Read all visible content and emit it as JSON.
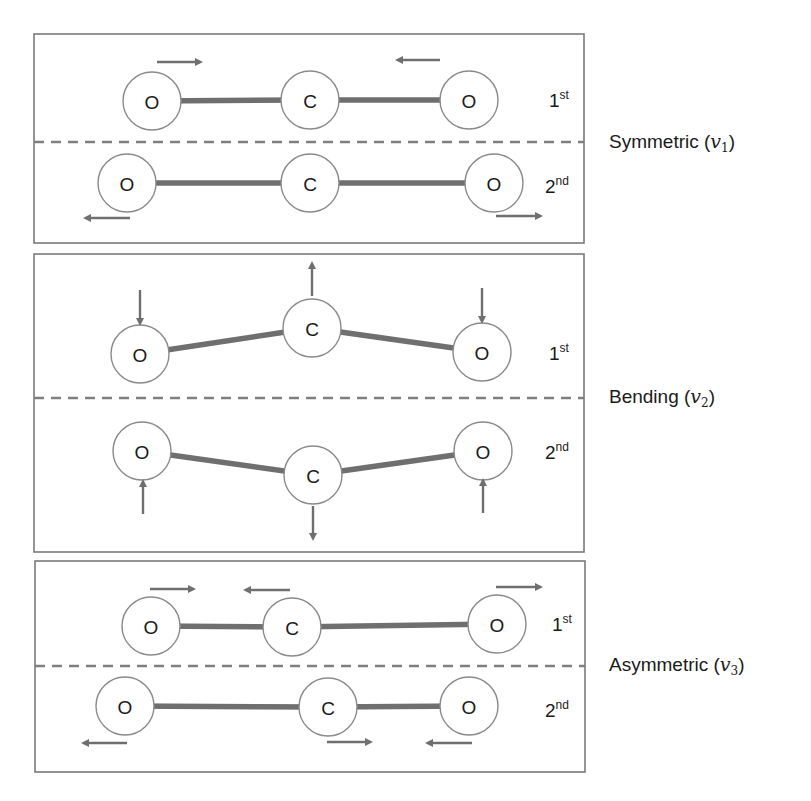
{
  "colors": {
    "stroke": "#6f6f6f",
    "panel_border": "#7a7a7a",
    "atom_fill": "#ffffff",
    "text": "#1a1a1a"
  },
  "panels": [
    {
      "name": "symmetric",
      "mode_label": "Symmetric",
      "mode_symbol": "v",
      "mode_subscript": "1",
      "rows": [
        {
          "order": "1",
          "order_sup": "st",
          "atoms": [
            {
              "label": "O",
              "cx": 152,
              "cy": 101
            },
            {
              "label": "C",
              "cx": 310,
              "cy": 100
            },
            {
              "label": "O",
              "cx": 469,
              "cy": 100
            }
          ],
          "arrows": [
            {
              "dir": "right",
              "x1": 157,
              "y1": 62,
              "x2": 200,
              "y2": 62
            },
            {
              "dir": "left",
              "x1": 440,
              "y1": 60,
              "x2": 398,
              "y2": 60
            }
          ]
        },
        {
          "order": "2",
          "order_sup": "nd",
          "atoms": [
            {
              "label": "O",
              "cx": 127,
              "cy": 183
            },
            {
              "label": "C",
              "cx": 310,
              "cy": 183
            },
            {
              "label": "O",
              "cx": 494,
              "cy": 183
            }
          ],
          "arrows": [
            {
              "dir": "left",
              "x1": 130,
              "y1": 218,
              "x2": 86,
              "y2": 218
            },
            {
              "dir": "right",
              "x1": 496,
              "y1": 216,
              "x2": 540,
              "y2": 216
            }
          ]
        }
      ]
    },
    {
      "name": "bending",
      "mode_label": "Bending",
      "mode_symbol": "v",
      "mode_subscript": "2",
      "rows": [
        {
          "order": "1",
          "order_sup": "st",
          "atoms": [
            {
              "label": "O",
              "cx": 140,
              "cy": 354
            },
            {
              "label": "C",
              "cx": 312,
              "cy": 328
            },
            {
              "label": "O",
              "cx": 482,
              "cy": 352
            }
          ],
          "arrows": [
            {
              "dir": "down",
              "x1": 140,
              "y1": 290,
              "x2": 140,
              "y2": 323
            },
            {
              "dir": "up",
              "x1": 312,
              "y1": 296,
              "x2": 312,
              "y2": 264
            },
            {
              "dir": "down",
              "x1": 482,
              "y1": 288,
              "x2": 482,
              "y2": 321
            }
          ]
        },
        {
          "order": "2",
          "order_sup": "nd",
          "atoms": [
            {
              "label": "O",
              "cx": 142,
              "cy": 451
            },
            {
              "label": "C",
              "cx": 313,
              "cy": 475
            },
            {
              "label": "O",
              "cx": 483,
              "cy": 451
            }
          ],
          "arrows": [
            {
              "dir": "up",
              "x1": 143,
              "y1": 514,
              "x2": 143,
              "y2": 482
            },
            {
              "dir": "down",
              "x1": 313,
              "y1": 506,
              "x2": 313,
              "y2": 538
            },
            {
              "dir": "up",
              "x1": 483,
              "y1": 513,
              "x2": 483,
              "y2": 481
            }
          ]
        }
      ]
    },
    {
      "name": "asymmetric",
      "mode_label": "Asymmetric",
      "mode_symbol": "v",
      "mode_subscript": "3",
      "rows": [
        {
          "order": "1",
          "order_sup": "st",
          "atoms": [
            {
              "label": "O",
              "cx": 151,
              "cy": 626
            },
            {
              "label": "C",
              "cx": 292,
              "cy": 627
            },
            {
              "label": "O",
              "cx": 497,
              "cy": 624
            }
          ],
          "arrows": [
            {
              "dir": "right",
              "x1": 150,
              "y1": 589,
              "x2": 193,
              "y2": 589
            },
            {
              "dir": "left",
              "x1": 290,
              "y1": 590,
              "x2": 246,
              "y2": 590
            },
            {
              "dir": "right",
              "x1": 496,
              "y1": 587,
              "x2": 540,
              "y2": 587
            }
          ]
        },
        {
          "order": "2",
          "order_sup": "nd",
          "atoms": [
            {
              "label": "O",
              "cx": 125,
              "cy": 706
            },
            {
              "label": "C",
              "cx": 328,
              "cy": 707
            },
            {
              "label": "O",
              "cx": 469,
              "cy": 706
            }
          ],
          "arrows": [
            {
              "dir": "left",
              "x1": 127,
              "y1": 743,
              "x2": 84,
              "y2": 743
            },
            {
              "dir": "right",
              "x1": 327,
              "y1": 742,
              "x2": 370,
              "y2": 742
            },
            {
              "dir": "left",
              "x1": 472,
              "y1": 743,
              "x2": 428,
              "y2": 743
            }
          ]
        }
      ]
    }
  ]
}
